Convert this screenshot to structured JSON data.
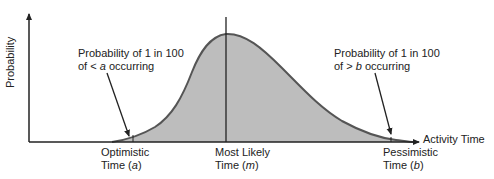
{
  "diagram": {
    "type": "beta-distribution-pert",
    "y_axis_label": "Probability",
    "x_axis_label": "Activity Time",
    "annotations": {
      "left": {
        "line1": "Probability of 1 in 100",
        "line2_prefix": "of < ",
        "line2_var": "a",
        "line2_suffix": " occurring"
      },
      "right": {
        "line1": "Probability of 1 in 100",
        "line2_prefix": "of > ",
        "line2_var": "b",
        "line2_suffix": " occurring"
      }
    },
    "markers": [
      {
        "id": "optimistic",
        "line1": "Optimistic",
        "line2_prefix": "Time (",
        "var": "a",
        "line2_suffix": ")"
      },
      {
        "id": "most-likely",
        "line1": "Most Likely",
        "line2_prefix": "Time (",
        "var": "m",
        "line2_suffix": ")"
      },
      {
        "id": "pessimistic",
        "line1": "Pessimistic",
        "line2_prefix": "Time (",
        "var": "b",
        "line2_suffix": ")"
      }
    ],
    "colors": {
      "fill": "#bdbdbd",
      "curve": "#555555",
      "axis": "#222222",
      "text": "#222222"
    }
  }
}
